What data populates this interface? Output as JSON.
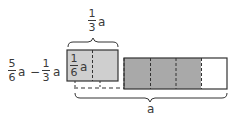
{
  "diagram": {
    "top_label": {
      "numerator": "1",
      "denominator": "3",
      "variable": "a"
    },
    "left_label": {
      "term1": {
        "numerator": "5",
        "denominator": "6",
        "variable": "a"
      },
      "operator": "−",
      "term2": {
        "numerator": "1",
        "denominator": "3",
        "variable": "a"
      }
    },
    "inner_label": {
      "numerator": "1",
      "denominator": "6",
      "variable": "a"
    },
    "bottom_label": "a",
    "colors": {
      "light_shade": "#cfcfcf",
      "dark_shade": "#a9a9a9",
      "stroke": "#333333",
      "empty": "#ffffff"
    }
  }
}
